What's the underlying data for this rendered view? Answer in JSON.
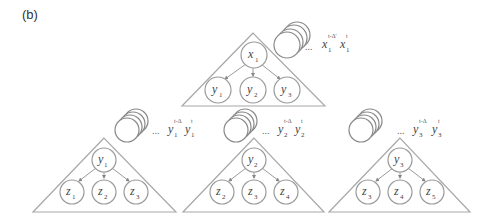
{
  "panel_label": "(b)",
  "trees": [
    {
      "id": "top",
      "root": {
        "var": "x",
        "sub": "1"
      },
      "children": [
        {
          "var": "y",
          "sub": "1"
        },
        {
          "var": "y",
          "sub": "2"
        },
        {
          "var": "y",
          "sub": "3"
        }
      ],
      "history": {
        "var": "x",
        "sub": "1",
        "sup_past": "t-Δ'",
        "sup_now": "t",
        "ellipsis": "..."
      }
    },
    {
      "id": "left",
      "root": {
        "var": "y",
        "sub": "1"
      },
      "children": [
        {
          "var": "z",
          "sub": "1"
        },
        {
          "var": "z",
          "sub": "2"
        },
        {
          "var": "z",
          "sub": "3"
        }
      ],
      "history": {
        "var": "y",
        "sub": "1",
        "sup_past": "t-Δ",
        "sup_now": "t",
        "ellipsis": "..."
      }
    },
    {
      "id": "middle",
      "root": {
        "var": "y",
        "sub": "2"
      },
      "children": [
        {
          "var": "z",
          "sub": "2"
        },
        {
          "var": "z",
          "sub": "3"
        },
        {
          "var": "z",
          "sub": "4"
        }
      ],
      "history": {
        "var": "y",
        "sub": "2",
        "sup_past": "t-Δ",
        "sup_now": "t",
        "ellipsis": "..."
      }
    },
    {
      "id": "right",
      "root": {
        "var": "y",
        "sub": "3"
      },
      "children": [
        {
          "var": "z",
          "sub": "3"
        },
        {
          "var": "z",
          "sub": "4"
        },
        {
          "var": "z",
          "sub": "5"
        }
      ],
      "history": {
        "var": "y",
        "sub": "3",
        "sup_past": "t-Δ",
        "sup_now": "t",
        "ellipsis": "..."
      }
    }
  ]
}
